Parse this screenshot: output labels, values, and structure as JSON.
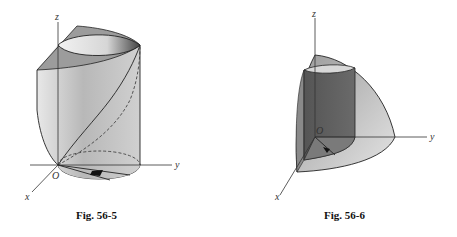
{
  "figures": [
    {
      "id": "fig-56-5",
      "caption": "Fig. 56-5",
      "description": "Cylinder cut by a slanted plane, first-octant region with dashed base curve",
      "axes": {
        "x": "x",
        "y": "y",
        "z": "z",
        "origin": "O"
      }
    },
    {
      "id": "fig-56-6",
      "caption": "Fig. 56-6",
      "description": "Sphere octant with inscribed cylinder",
      "axes": {
        "x": "x",
        "y": "y",
        "z": "z",
        "origin": "O"
      }
    }
  ]
}
